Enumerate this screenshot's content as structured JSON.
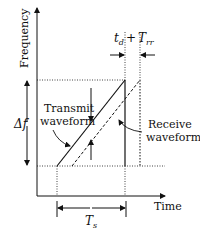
{
  "diagram": {
    "type": "fmcw-sawtooth-chirp",
    "y_axis_label": "Frequency",
    "x_axis_label": "Time",
    "bandwidth_label": "Δf",
    "sweep_time_label_main": "T",
    "sweep_time_label_sub": "s",
    "delay_label": {
      "t": "t",
      "t_sub": "d",
      "plus": "+",
      "T": "T",
      "T_sub": "rr"
    },
    "transmit_label_line1": "Transmit",
    "transmit_label_line2": "waveform",
    "receive_label_line1": "Receive",
    "receive_label_line2": "waveform",
    "colors": {
      "line": "#111111",
      "background": "#ffffff"
    }
  }
}
